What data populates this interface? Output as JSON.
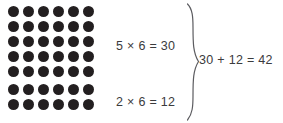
{
  "figure": {
    "background_color": "#ffffff",
    "dot_color": "#231f20",
    "text_color": "#3b3b3d",
    "brace_color": "#5c5c60"
  },
  "arrays": [
    {
      "name": "top-array",
      "rows": 5,
      "columns": 6,
      "total_dots": 30,
      "equation": "5 × 6 = 30"
    },
    {
      "name": "bottom-array",
      "rows": 2,
      "columns": 6,
      "total_dots": 12,
      "equation": "2 × 6 = 12"
    }
  ],
  "equations": {
    "top": "5 × 6 = 30",
    "bottom": "2 × 6 = 12",
    "sum": "30 + 12 = 42"
  },
  "brace": {
    "glyph": "right-curly-brace",
    "orientation": "points-right",
    "groups": 2
  }
}
